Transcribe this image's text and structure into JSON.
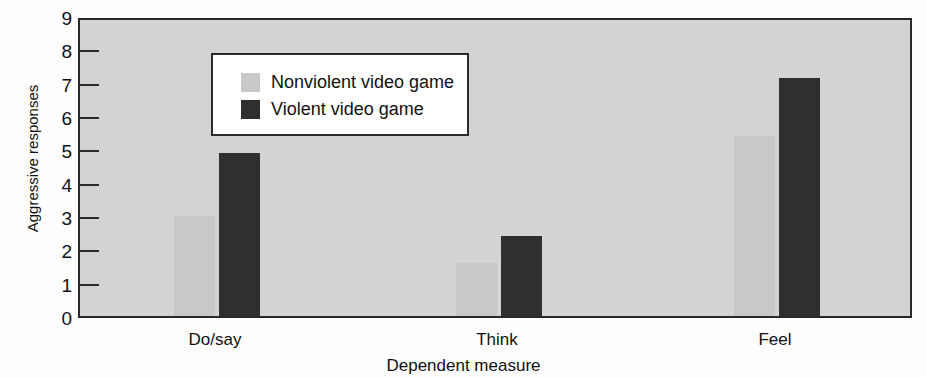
{
  "chart_data": {
    "type": "bar",
    "title": "",
    "xlabel": "Dependent measure",
    "ylabel": "Aggressive responses",
    "categories": [
      "Do/say",
      "Think",
      "Feel"
    ],
    "series": [
      {
        "name": "Nonviolent video game",
        "values": [
          3.0,
          1.6,
          5.4
        ],
        "color": "#c8c8c8"
      },
      {
        "name": "Violent video game",
        "values": [
          4.9,
          2.4,
          7.15
        ],
        "color": "#2f2f2f"
      }
    ],
    "ylim": [
      0,
      9
    ],
    "yticks": [
      0,
      1,
      2,
      3,
      4,
      5,
      6,
      7,
      8,
      9
    ],
    "ytick_labels": [
      "0",
      "1",
      "2",
      "3",
      "4",
      "5",
      "6",
      "7",
      "8",
      "9"
    ],
    "grid": false,
    "legend_position": "upper-left",
    "plot_background": "#d3d3d3",
    "axis_color": "#2a2a2a"
  },
  "legend": {
    "entries": [
      {
        "label": "Nonviolent video game",
        "swatch": "#c8c8c8"
      },
      {
        "label": "Violent video game",
        "swatch": "#2f2f2f"
      }
    ]
  },
  "axes": {
    "y_title": "Aggressive responses",
    "x_title": "Dependent measure"
  }
}
